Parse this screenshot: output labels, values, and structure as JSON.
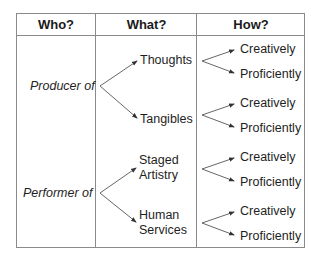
{
  "headers": {
    "who": "Who?",
    "what": "What?",
    "how": "How?"
  },
  "rows": [
    {
      "who": "Producer of",
      "what": [
        {
          "label": "Thoughts",
          "how": [
            "Creatively",
            "Proficiently"
          ]
        },
        {
          "label": "Tangibles",
          "how": [
            "Creatively",
            "Proficiently"
          ]
        }
      ]
    },
    {
      "who": "Performer of",
      "what": [
        {
          "label_line1": "Staged",
          "label_line2": "Artistry",
          "how": [
            "Creatively",
            "Proficiently"
          ]
        },
        {
          "label_line1": "Human",
          "label_line2": "Services",
          "how": [
            "Creatively",
            "Proficiently"
          ]
        }
      ]
    }
  ],
  "colors": {
    "border": "#8a8a8a",
    "arrow": "#555555",
    "text": "#1e1e1e"
  }
}
